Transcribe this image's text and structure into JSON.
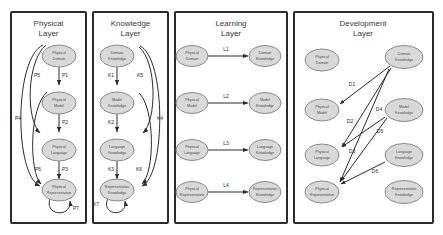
{
  "diagram": {
    "node_fill": "#d9d9d9",
    "node_stroke": "#8a8a8a",
    "panel_stroke": "#2b2b2b",
    "edge_color": "#2b2b2b"
  },
  "panels": [
    {
      "id": "physical-layer",
      "title": "Physical\nLayer",
      "title_line1": "Physical",
      "title_line2": "Layer",
      "nodes": [
        {
          "id": "physical-domain",
          "line1": "Physical",
          "line2": "Domain"
        },
        {
          "id": "physical-model",
          "line1": "Physical",
          "line2": "Model"
        },
        {
          "id": "physical-language",
          "line1": "Physical",
          "line2": "Language"
        },
        {
          "id": "physical-representation",
          "line1": "Physical",
          "line2": "Representation"
        }
      ],
      "edges": [
        {
          "id": "P1",
          "label": "P1",
          "from": "physical-domain",
          "to": "physical-model",
          "kind": "straight"
        },
        {
          "id": "P2",
          "label": "P2",
          "from": "physical-model",
          "to": "physical-language",
          "kind": "straight"
        },
        {
          "id": "P3",
          "label": "P3",
          "from": "physical-language",
          "to": "physical-representation",
          "kind": "straight"
        },
        {
          "id": "P4",
          "label": "P4",
          "from": "physical-domain",
          "to": "physical-representation",
          "kind": "curve-outer"
        },
        {
          "id": "P5",
          "label": "P5",
          "from": "physical-domain",
          "to": "physical-language",
          "kind": "curve-inner"
        },
        {
          "id": "P6",
          "label": "P6",
          "from": "physical-model",
          "to": "physical-representation",
          "kind": "curve-inner"
        },
        {
          "id": "P7",
          "label": "P7",
          "from": "physical-representation",
          "to": "physical-representation",
          "kind": "self-loop"
        }
      ]
    },
    {
      "id": "knowledge-layer",
      "title": "Knowledge\nLayer",
      "title_line1": "Knowledge",
      "title_line2": "Layer",
      "nodes": [
        {
          "id": "domain-knowledge",
          "line1": "Domain",
          "line2": "Knowledge"
        },
        {
          "id": "model-knowledge",
          "line1": "Model",
          "line2": "Knowledge"
        },
        {
          "id": "language-knowledge",
          "line1": "Language",
          "line2": "Knowledge"
        },
        {
          "id": "representation-knowledge",
          "line1": "Representation",
          "line2": "Knowledge"
        }
      ],
      "edges": [
        {
          "id": "K1",
          "label": "K1",
          "from": "domain-knowledge",
          "to": "model-knowledge",
          "kind": "straight"
        },
        {
          "id": "K2",
          "label": "K2",
          "from": "model-knowledge",
          "to": "language-knowledge",
          "kind": "straight"
        },
        {
          "id": "K3",
          "label": "K3",
          "from": "language-knowledge",
          "to": "representation-knowledge",
          "kind": "straight"
        },
        {
          "id": "K4",
          "label": "K4",
          "from": "domain-knowledge",
          "to": "representation-knowledge",
          "kind": "curve-outer"
        },
        {
          "id": "K5",
          "label": "K5",
          "from": "domain-knowledge",
          "to": "language-knowledge",
          "kind": "curve-inner"
        },
        {
          "id": "K6",
          "label": "K6",
          "from": "model-knowledge",
          "to": "representation-knowledge",
          "kind": "curve-inner"
        },
        {
          "id": "K7",
          "label": "K7",
          "from": "representation-knowledge",
          "to": "representation-knowledge",
          "kind": "self-loop"
        }
      ]
    },
    {
      "id": "learning-layer",
      "title": "Learning\nLayer",
      "title_line1": "Learning",
      "title_line2": "Layer",
      "nodes": [
        {
          "id": "l-physical-domain",
          "line1": "Physical",
          "line2": "Domain"
        },
        {
          "id": "l-domain-knowledge",
          "line1": "Domain",
          "line2": "Knowledge"
        },
        {
          "id": "l-physical-model",
          "line1": "Physical",
          "line2": "Model"
        },
        {
          "id": "l-model-knowledge",
          "line1": "Model",
          "line2": "Knowledge"
        },
        {
          "id": "l-physical-language",
          "line1": "Physical",
          "line2": "Language"
        },
        {
          "id": "l-language-knowledge",
          "line1": "Language",
          "line2": "Knowledge"
        },
        {
          "id": "l-physical-representation",
          "line1": "Physical",
          "line2": "Representation"
        },
        {
          "id": "l-representation-knowledge",
          "line1": "Representation",
          "line2": "Knowledge"
        }
      ],
      "edges": [
        {
          "id": "L1",
          "label": "L1",
          "from": "l-physical-domain",
          "to": "l-domain-knowledge",
          "kind": "straight-h"
        },
        {
          "id": "L2",
          "label": "L2",
          "from": "l-physical-model",
          "to": "l-model-knowledge",
          "kind": "straight-h"
        },
        {
          "id": "L3",
          "label": "L3",
          "from": "l-physical-language",
          "to": "l-language-knowledge",
          "kind": "straight-h"
        },
        {
          "id": "L4",
          "label": "L4",
          "from": "l-physical-representation",
          "to": "l-representation-knowledge",
          "kind": "straight-h"
        }
      ]
    },
    {
      "id": "development-layer",
      "title": "Development\nLayer",
      "title_line1": "Development",
      "title_line2": "Layer",
      "nodes": [
        {
          "id": "d-physical-domain",
          "line1": "Physical",
          "line2": "Domain"
        },
        {
          "id": "d-domain-knowledge",
          "line1": "Domain",
          "line2": "Knowledge"
        },
        {
          "id": "d-physical-model",
          "line1": "Physical",
          "line2": "Model"
        },
        {
          "id": "d-model-knowledge",
          "line1": "Model",
          "line2": "Knowledge"
        },
        {
          "id": "d-physical-language",
          "line1": "Physical",
          "line2": "Language"
        },
        {
          "id": "d-language-knowledge",
          "line1": "Language",
          "line2": "Knowledge"
        },
        {
          "id": "d-physical-representation",
          "line1": "Physical",
          "line2": "Representation"
        },
        {
          "id": "d-representation-knowledge",
          "line1": "Representation",
          "line2": "Knowledge"
        }
      ],
      "edges": [
        {
          "id": "D1",
          "label": "D1",
          "from": "d-domain-knowledge",
          "to": "d-physical-model",
          "kind": "diagonal"
        },
        {
          "id": "D2",
          "label": "D2",
          "from": "d-domain-knowledge",
          "to": "d-physical-language",
          "kind": "diagonal"
        },
        {
          "id": "D3",
          "label": "D3",
          "from": "d-domain-knowledge",
          "to": "d-physical-representation",
          "kind": "diagonal"
        },
        {
          "id": "D4",
          "label": "D4",
          "from": "d-model-knowledge",
          "to": "d-physical-language",
          "kind": "diagonal"
        },
        {
          "id": "D5",
          "label": "D5",
          "from": "d-model-knowledge",
          "to": "d-physical-representation",
          "kind": "diagonal"
        },
        {
          "id": "D6",
          "label": "D6",
          "from": "d-language-knowledge",
          "to": "d-physical-representation",
          "kind": "diagonal"
        }
      ]
    }
  ]
}
